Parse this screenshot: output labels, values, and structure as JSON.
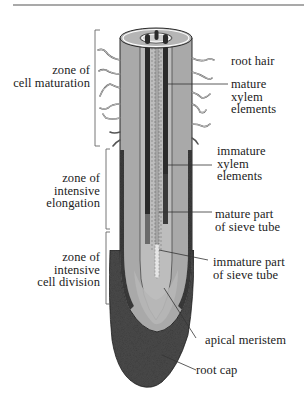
{
  "diagram": {
    "type": "longitudinal section of a root tip",
    "colors": {
      "outline": "#2a2a2a",
      "cortex": "#a9a9a9",
      "stele": "#bdbdbd",
      "mature_xylem": "#2b2b2b",
      "immature_xylem": "#6a6a6a",
      "immature_sieve_tube": "#e6e6e6",
      "root_cap": "#4a4a4a",
      "meristem": "#b6b6b6",
      "rule_line": "#555555"
    },
    "zones": [
      {
        "id": "cell-maturation",
        "label": "zone of\ncell maturation"
      },
      {
        "id": "intensive-elongation",
        "label": "zone of\nintensive\nelongation"
      },
      {
        "id": "intensive-cell-division",
        "label": "zone of\nintensive\ncell division"
      }
    ],
    "callouts": [
      {
        "id": "root-hair",
        "label": "root hair"
      },
      {
        "id": "mature-xylem",
        "label": "mature\nxylem\nelements"
      },
      {
        "id": "immature-xylem",
        "label": "immature\nxylem\nelements"
      },
      {
        "id": "mature-sieve-tube",
        "label": "mature part\nof sieve tube"
      },
      {
        "id": "immature-sieve-tube",
        "label": "immature part\nof sieve tube"
      },
      {
        "id": "apical-meristem",
        "label": "apical meristem"
      },
      {
        "id": "root-cap",
        "label": "root cap"
      }
    ]
  }
}
